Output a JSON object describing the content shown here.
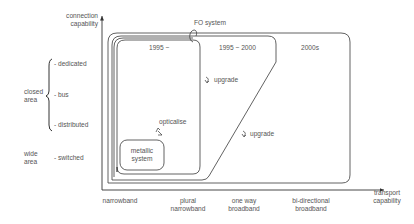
{
  "axes": {
    "y_label_line1": "connection",
    "y_label_line2": "capability",
    "x_label_line1": "transport",
    "x_label_line2": "capability"
  },
  "y_categories": {
    "closed_area_line1": "closed",
    "closed_area_line2": "area",
    "wide_area_line1": "wide",
    "wide_area_line2": "area",
    "dedicated": "- dedicated",
    "bus": "- bus",
    "distributed": "- distributed",
    "switched": "- switched"
  },
  "x_categories": [
    {
      "line1": "narrowband",
      "line2": ""
    },
    {
      "line1": "plural",
      "line2": "narrowband"
    },
    {
      "line1": "one way",
      "line2": "broadband"
    },
    {
      "line1": "bi-directional",
      "line2": "broadband"
    }
  ],
  "regions": {
    "fo_system": "FO system",
    "era_1995": "1995 ~",
    "era_1995_2000": "1995 ~ 2000",
    "era_2000s": "2000s",
    "metallic_line1": "metallic",
    "metallic_line2": "system"
  },
  "transitions": {
    "opticalise": "opticalise",
    "upgrade_1": "upgrade",
    "upgrade_2": "upgrade"
  },
  "colors": {
    "line": "#3a3a3a",
    "text": "#555555"
  }
}
